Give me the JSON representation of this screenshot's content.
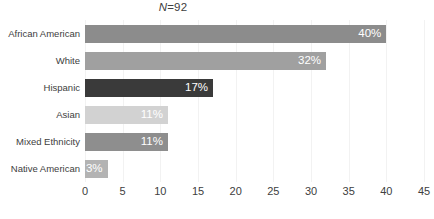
{
  "annotation": {
    "n_label_prefix": "N",
    "n_label_rest": "=92",
    "n_label_full": "N=92"
  },
  "chart_data": {
    "type": "bar",
    "orientation": "horizontal",
    "title": "",
    "subtitle": "",
    "xlabel": "",
    "ylabel": "",
    "xlim": [
      0,
      45
    ],
    "xticks": [
      0,
      5,
      10,
      15,
      20,
      25,
      30,
      35,
      40,
      45
    ],
    "xtick_labels": [
      "0",
      "5",
      "10",
      "15",
      "20",
      "25",
      "30",
      "35",
      "40",
      "45"
    ],
    "grid": "vertical",
    "legend": "none",
    "annotations": [
      "N=92"
    ],
    "categories": [
      "African American",
      "White",
      "Hispanic",
      "Asian",
      "Mixed Ethnicity",
      "Native American"
    ],
    "values": [
      40,
      32,
      17,
      11,
      11,
      3
    ],
    "data_labels": [
      "40%",
      "32%",
      "17%",
      "11%",
      "11%",
      "3%"
    ],
    "bar_colors": [
      "#8c8c8c",
      "#a0a0a0",
      "#3a3a3a",
      "#d2d2d2",
      "#8e8e8e",
      "#b3b3b3"
    ]
  },
  "colors": {
    "background": "#ffffff",
    "text": "#404040",
    "gridline": "#f2f2f2",
    "data_label_text": "#ffffff"
  }
}
